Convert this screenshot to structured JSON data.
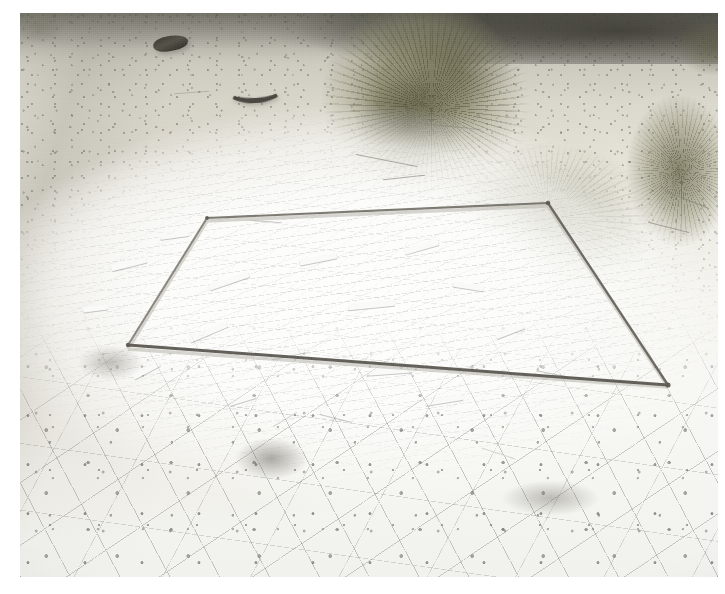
{
  "image": {
    "kind": "natural-photograph",
    "title": "Field vegetation quadrat on white gypsum desert crust",
    "orientation": "landscape",
    "width_px": 725,
    "height_px": 594,
    "border": {
      "color": "#ffffff",
      "left_px": 20,
      "top_px": 13,
      "right_px": 7,
      "bottom_px": 17
    }
  },
  "scene": {
    "setting": "Arid alkali flat / gypsum playa margin, bright midday overcast light",
    "viewpoint": "Oblique downward, camera held about chest height looking at the ground",
    "season_cue": "Dry season, senescent grey-green shrub foliage",
    "description": "A square metal survey quadrat rests on bare white gypsum crust; desert shrubs occupy the upper right, cracked clay polygons fill the foreground."
  },
  "subjects": {
    "quadrat": {
      "label": "Square metal quadrat frame",
      "material": "Thin steel / aluminium rod, weathered grey",
      "rod_color": "#6f6d64",
      "corners": {
        "top_left": "207,218",
        "top_right": "548,203",
        "bottom_right": "668,385",
        "bottom_left": "128,345"
      },
      "note": "Viewed in strong perspective so the square reads as a wide trapezoid"
    },
    "ground_cover": [
      {
        "name": "gypsum-crust",
        "label": "Bright white gypsum / salt crust with plate-like flakes",
        "color": "#fdfdfc",
        "location": "centre of frame, inside and around the quadrat"
      },
      {
        "name": "cracked-clay",
        "label": "Desiccation-cracked clay polygons",
        "color": "#f3f3f0",
        "location": "lower third of the frame"
      },
      {
        "name": "sandy-silt",
        "label": "Pale grey-tan sandy silt with scattered grit",
        "color": "#d8d5cb",
        "location": "upper left quadrant"
      }
    ],
    "vegetation": [
      {
        "name": "shrub-main",
        "label": "Large grey-green desert shrub (saltbush / greasewood habit)",
        "color": "#7a7858",
        "location": "upper right of centre"
      },
      {
        "name": "shrub-lower",
        "label": "Low spreading shrub overhanging the frame corner",
        "color": "#8c8a6e",
        "location": "right of the quadrat's top-right corner"
      },
      {
        "name": "shrub-right",
        "label": "Shrub clipped by the right image edge",
        "color": "#76745a",
        "location": "right edge, middle height"
      },
      {
        "name": "far-vegetation",
        "label": "Dark out-of-focus vegetation band on the horizon",
        "color": "#3a3932",
        "location": "top edge"
      }
    ],
    "debris": [
      {
        "name": "debris-can",
        "label": "Dark cylindrical object (rusted can or tube)",
        "color": "#474539",
        "location": "upper left, on bare silt"
      },
      {
        "name": "debris-curved",
        "label": "Dark curved object (bone or bent piece of metal)",
        "color": "#4a4840",
        "location": "upper centre-left"
      }
    ]
  },
  "palette": {
    "paper_white": "#ffffff",
    "crust_white": "#fdfdfc",
    "pale_silt": "#d8d5cb",
    "mid_grey": "#a9a79d",
    "shadow_grey": "#6f6d64",
    "shrub_khaki": "#7a7858",
    "dark_vegetation": "#3a3932",
    "debris_dark": "#474539"
  },
  "capture": {
    "lighting": "Flat, very bright — crust is near clipping white",
    "focus": "Sharp on the quadrat and near ground, softer toward the horizon",
    "grain": "Visible fine scanned-film grain across the whole plate"
  }
}
